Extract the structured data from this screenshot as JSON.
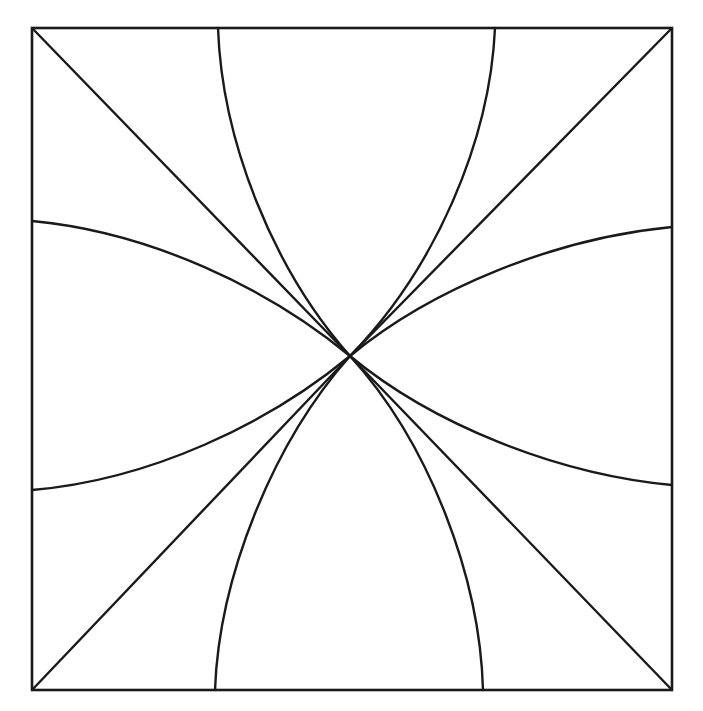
{
  "figure": {
    "background_color": "#ffffff",
    "stroke_color": "#1a1a1a",
    "frame_stroke_width": 2.6,
    "curve_stroke_width": 2.4
  },
  "chart_data": {
    "type": "line",
    "subtitle": "",
    "xlabel": "",
    "ylabel": "",
    "grid": false,
    "legend": false,
    "xlim": [
      32,
      672
    ],
    "ylim": [
      28,
      690
    ],
    "annotations": [],
    "node": {
      "label": "common intersection point",
      "x": 350,
      "y": 356
    },
    "frame": {
      "label": "square border",
      "x0": 32,
      "y0": 28,
      "x1": 672,
      "y1": 690,
      "width": 640,
      "height": 662
    },
    "series": [
      {
        "name": "diagonal-nw-se",
        "kind": "straight",
        "endpoints": [
          [
            32,
            28
          ],
          [
            672,
            690
          ]
        ],
        "path": "M 32 28 L 350 356 L 672 690"
      },
      {
        "name": "diagonal-sw-ne",
        "kind": "straight",
        "endpoints": [
          [
            32,
            690
          ],
          [
            672,
            28
          ]
        ],
        "path": "M 32 690 L 350 356 L 672 28"
      },
      {
        "name": "shallow-curve-upper",
        "kind": "curved",
        "endpoints": [
          [
            32,
            221
          ],
          [
            672,
            227
          ]
        ],
        "path": "M 32 221 C 150 232 268 288 350 356 C 432 288 556 238 672 227"
      },
      {
        "name": "shallow-curve-lower",
        "kind": "curved",
        "endpoints": [
          [
            32,
            490
          ],
          [
            672,
            485
          ]
        ],
        "path": "M 32 490 C 150 480 268 424 350 356 C 432 424 556 474 672 485"
      },
      {
        "name": "steep-curve-left",
        "kind": "curved",
        "endpoints": [
          [
            218,
            28
          ],
          [
            215,
            690
          ]
        ],
        "path": "M 218 28 C 222 140 272 268 350 356 C 272 444 219 578 215 690"
      },
      {
        "name": "steep-curve-right",
        "kind": "curved",
        "endpoints": [
          [
            495,
            28
          ],
          [
            483,
            690
          ]
        ],
        "path": "M 495 28 C 490 140 436 268 350 356 C 430 444 480 578 483 690"
      }
    ]
  }
}
